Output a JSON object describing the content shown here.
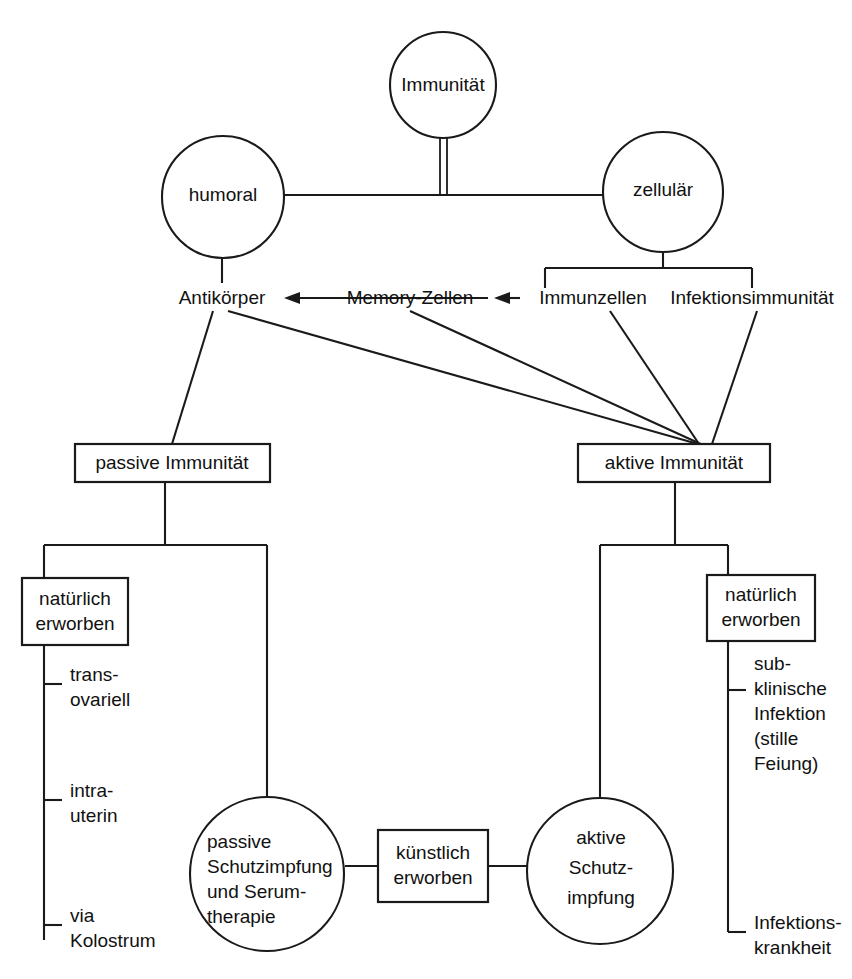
{
  "diagram": {
    "title_node": {
      "label": "Immunität"
    },
    "branches": [
      {
        "id": "humoral",
        "label": "humoral"
      },
      {
        "id": "zellulaer",
        "label": "zellulär"
      }
    ],
    "mediators": [
      {
        "id": "antikoerper",
        "label": "Antikörper"
      },
      {
        "id": "memory-zellen",
        "label": "Memory-Zellen"
      },
      {
        "id": "immunzellen",
        "label": "Immunzellen"
      },
      {
        "id": "infektionsimmunitaet",
        "label": "Infektionsimmunität"
      }
    ],
    "immunity_types": [
      {
        "id": "passive-immunitaet",
        "label": "passive Immunität"
      },
      {
        "id": "aktive-immunitaet",
        "label": "aktive Immunität"
      }
    ],
    "acquisition_boxes": [
      {
        "id": "natuerlich-erworben-links",
        "line1": "natürlich",
        "line2": "erworben"
      },
      {
        "id": "natuerlich-erworben-rechts",
        "line1": "natürlich",
        "line2": "erworben"
      },
      {
        "id": "kuenstlich-erworben",
        "line1": "künstlich",
        "line2": "erworben"
      }
    ],
    "passive_natural_routes": [
      {
        "id": "transovariell",
        "line1": "trans-",
        "line2": "ovariell"
      },
      {
        "id": "intrauterin",
        "line1": "intra-",
        "line2": "uterin"
      },
      {
        "id": "via-kolostrum",
        "line1": "via",
        "line2": "Kolostrum"
      }
    ],
    "active_natural_routes": [
      {
        "id": "subklinische-infektion",
        "line1": "sub-",
        "line2": "klinische",
        "line3": "Infektion",
        "line4": "(stille",
        "line5": "Feiung)"
      },
      {
        "id": "infektionskrankheit",
        "line1": "Infektions-",
        "line2": "krankheit"
      }
    ],
    "vaccination_nodes": [
      {
        "id": "passive-schutzimpfung",
        "line1": "passive",
        "line2": "Schutzimpfung",
        "line3": "und Serum-",
        "line4": "therapie"
      },
      {
        "id": "aktive-schutzimpfung",
        "line1": "aktive",
        "line2": "Schutz-",
        "line3": "impfung"
      }
    ],
    "colors": {
      "stroke": "#1a1a1a",
      "text": "#111111",
      "background": "#ffffff"
    }
  }
}
